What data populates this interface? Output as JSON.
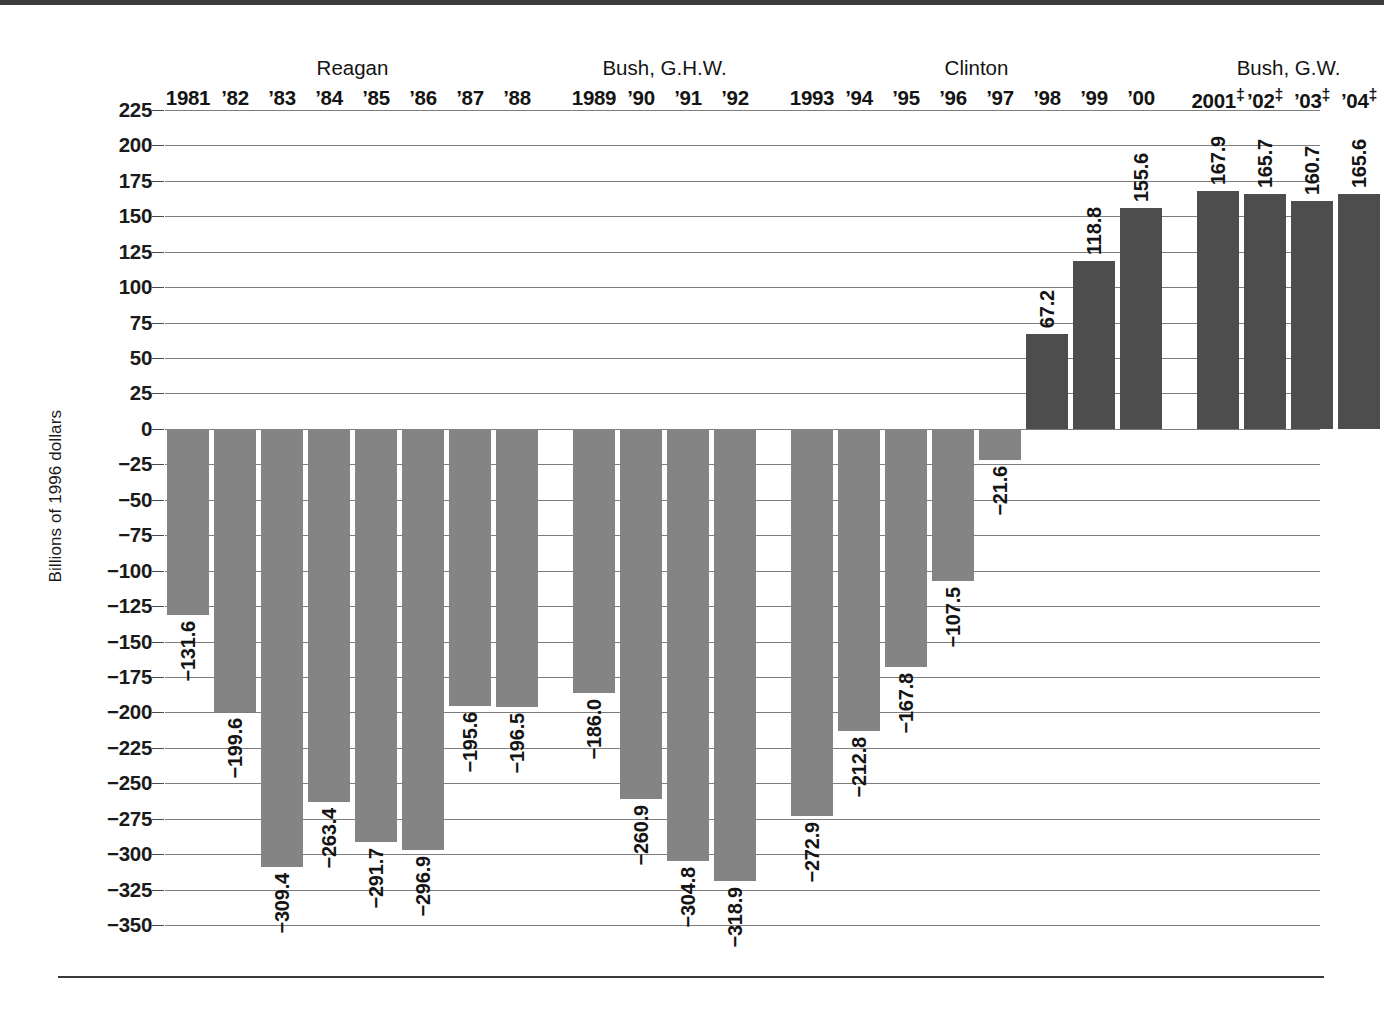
{
  "chart_data": {
    "type": "bar",
    "title": "",
    "xlabel": "",
    "ylabel": "Billions of 1996 dollars",
    "ylim": [
      -350,
      225
    ],
    "ytick_step": 25,
    "grid": true,
    "legend": "none",
    "yticks": [
      "225",
      "200",
      "175",
      "150",
      "125",
      "100",
      "75",
      "50",
      "25",
      "0",
      "−25",
      "−50",
      "−75",
      "−100",
      "−125",
      "−150",
      "−175",
      "−200",
      "−225",
      "−250",
      "−275",
      "−300",
      "−325",
      "−350"
    ],
    "categories": [
      "1981",
      "'82",
      "'83",
      "'84",
      "'85",
      "'86",
      "'87",
      "'88",
      "1989",
      "'90",
      "'91",
      "'92",
      "1993",
      "'94",
      "'95",
      "'96",
      "'97",
      "'98",
      "'99",
      "'00",
      "2001‡",
      "'02‡",
      "'03‡",
      "'04‡"
    ],
    "values": [
      -131.6,
      -199.6,
      -309.4,
      -263.4,
      -291.7,
      -296.9,
      -195.6,
      -196.5,
      -186.0,
      -260.9,
      -304.8,
      -318.9,
      -272.9,
      -212.8,
      -167.8,
      -107.5,
      -21.6,
      67.2,
      118.8,
      155.6,
      167.9,
      165.7,
      160.7,
      165.6
    ],
    "value_labels": [
      "−131.6",
      "−199.6",
      "−309.4",
      "−263.4",
      "−291.7",
      "−296.9",
      "−195.6",
      "−196.5",
      "−186.0",
      "−260.9",
      "−304.8",
      "−318.9",
      "−272.9",
      "−212.8",
      "−167.8",
      "−107.5",
      "−21.6",
      "67.2",
      "118.8",
      "155.6",
      "167.9",
      "165.7",
      "160.7",
      "165.6"
    ],
    "year_labels": [
      "1981",
      "’82",
      "’83",
      "’84",
      "’85",
      "’86",
      "’87",
      "’88",
      "1989",
      "’90",
      "’91",
      "’92",
      "1993",
      "’94",
      "’95",
      "’96",
      "’97",
      "’98",
      "’99",
      "’00",
      "2001",
      "’02",
      "’03",
      "’04"
    ],
    "year_dagger": [
      false,
      false,
      false,
      false,
      false,
      false,
      false,
      false,
      false,
      false,
      false,
      false,
      false,
      false,
      false,
      false,
      false,
      false,
      false,
      false,
      true,
      true,
      true,
      true
    ],
    "groups": [
      {
        "label": "Reagan",
        "start": 0,
        "end": 7
      },
      {
        "label": "Bush, G.H.W.",
        "start": 8,
        "end": 11
      },
      {
        "label": "Clinton",
        "start": 12,
        "end": 19
      },
      {
        "label": "Bush, G.W.",
        "start": 20,
        "end": 23
      }
    ],
    "colors": {
      "negative_bar": "#848484",
      "positive_bar": "#4d4d4d",
      "gridline": "#7d7d7d",
      "text": "#141414",
      "rule": "#3a3a3a"
    }
  }
}
